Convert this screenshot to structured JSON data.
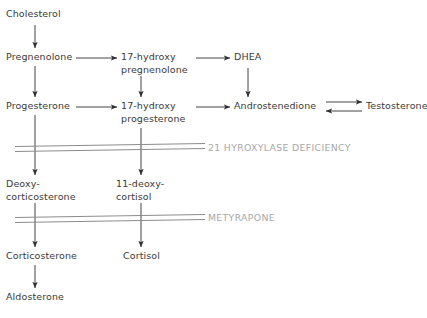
{
  "diagram": {
    "background_color": "#ffffff",
    "node_text_color": "#3a3a3a",
    "arrow_color": "#2f2f2f",
    "block_label_color": "#a8a8a8",
    "block_bar_color": "#8c8c8c"
  },
  "nodes": [
    {
      "id": "cholesterol",
      "label": "Cholesterol"
    },
    {
      "id": "pregnenolone",
      "label": "Pregnenolone"
    },
    {
      "id": "progesterone",
      "label": "Progesterone"
    },
    {
      "id": "17_hydroxy_pregnenolone",
      "label": "17-hydroxy\npregnenolone"
    },
    {
      "id": "17_hydroxy_progesterone",
      "label": "17-hydroxy\nprogesterone"
    },
    {
      "id": "dhea",
      "label": "DHEA"
    },
    {
      "id": "androstenedione",
      "label": "Androstenedione"
    },
    {
      "id": "testosterone",
      "label": "Testosterone"
    },
    {
      "id": "deoxycorticosterone",
      "label": "Deoxy-\ncorticosterone"
    },
    {
      "id": "11_deoxycortisol",
      "label": "11-deoxy-\ncortisol"
    },
    {
      "id": "corticosterone",
      "label": "Corticosterone"
    },
    {
      "id": "cortisol",
      "label": "Cortisol"
    },
    {
      "id": "aldosterone",
      "label": "Aldosterone"
    }
  ],
  "blocks": [
    {
      "id": "block_21_hydroxylase",
      "label": "21 HYROXYLASE DEFICIENCY"
    },
    {
      "id": "block_metyrapone",
      "label": "METYRAPONE"
    }
  ]
}
